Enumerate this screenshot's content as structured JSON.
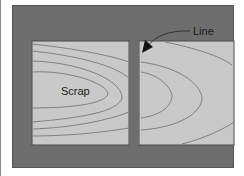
{
  "diagram": {
    "labels": {
      "scrap": "Scrap",
      "line": "Line"
    },
    "colors": {
      "background_panel": "#6e6e6e",
      "board_fill": "#c9c9c9",
      "grain_line": "#808080",
      "arrow": "#111111"
    }
  }
}
